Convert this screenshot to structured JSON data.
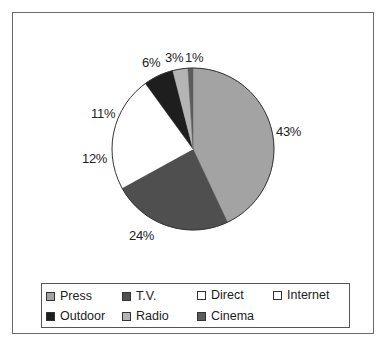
{
  "chart_data": {
    "type": "pie",
    "title": "",
    "categories": [
      "Press",
      "T.V.",
      "Direct",
      "Internet",
      "Outdoor",
      "Radio",
      "Cinema"
    ],
    "values": [
      43,
      24,
      12,
      11,
      6,
      3,
      1
    ],
    "labels": [
      "43%",
      "24%",
      "12%",
      "11%",
      "6%",
      "3%",
      "1%"
    ],
    "colors": [
      "#a3a3a3",
      "#4f4f4f",
      "#ffffff",
      "#ffffff",
      "#1e1e1e",
      "#b4b4b4",
      "#5c5c5c"
    ],
    "start_angle": "12 o'clock",
    "direction": "clockwise",
    "legend_position": "bottom"
  },
  "legend": {
    "items": [
      {
        "label": "Press",
        "color": "#a3a3a3"
      },
      {
        "label": "T.V.",
        "color": "#4f4f4f"
      },
      {
        "label": "Direct",
        "color": "#ffffff"
      },
      {
        "label": "Internet",
        "color": "#ffffff"
      },
      {
        "label": "Outdoor",
        "color": "#1e1e1e"
      },
      {
        "label": "Radio",
        "color": "#b4b4b4"
      },
      {
        "label": "Cinema",
        "color": "#5c5c5c"
      }
    ]
  }
}
